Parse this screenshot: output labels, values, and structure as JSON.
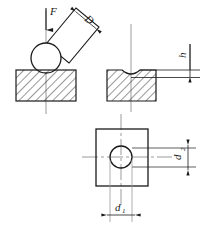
{
  "figure": {
    "background_color": "#ffffff",
    "line_color": "#1a1a1a",
    "hatch_color": "#1a1a1a",
    "centerline_color": "#8c8c8c",
    "width": 210,
    "height": 233
  },
  "labels": {
    "force": "F",
    "ball_diameter": "D",
    "indent_depth": "h",
    "indent_diameter_main": "d",
    "indent_diameter_main_sub": "1",
    "indent_diameter_secondary": "d",
    "indent_diameter_secondary_sub": "2"
  },
  "views": {
    "loading": {
      "name": "loading-view",
      "description": "Inclined indenter rod pressing a ball into a hatched specimen block",
      "force_arrow_direction": "down"
    },
    "indentation": {
      "name": "indentation-view",
      "description": "Sectioned specimen showing residual indentation of depth h"
    },
    "plan": {
      "name": "plan-view",
      "description": "Top view of square specimen with circular indentation, dimensions d1 and d2"
    }
  }
}
